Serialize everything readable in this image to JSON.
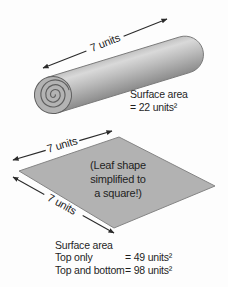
{
  "figure": {
    "cylinder": {
      "length_label": "7 units",
      "surface_area": {
        "line1": "Surface area",
        "line2": "= 22 units²"
      }
    },
    "square": {
      "top_edge_label": "7 units",
      "left_edge_label": "7 units",
      "note": {
        "line1": "(Leaf shape",
        "line2": "simplified to",
        "line3": "a square!)"
      },
      "surface_area": {
        "title": "Surface area",
        "rows": [
          {
            "label": "Top only",
            "value": "= 49 units²"
          },
          {
            "label": "Top and bottom",
            "value": "= 98 units²"
          }
        ]
      }
    },
    "colors": {
      "background": "#fdfdfd",
      "shape_fill": "#b2b2b2",
      "shape_edge": "#858585",
      "cylinder_highlight": "#d9d9d9",
      "cylinder_shadow": "#8c8c8c",
      "arrow": "#2b2b2b",
      "text": "#1f1f1f"
    }
  }
}
